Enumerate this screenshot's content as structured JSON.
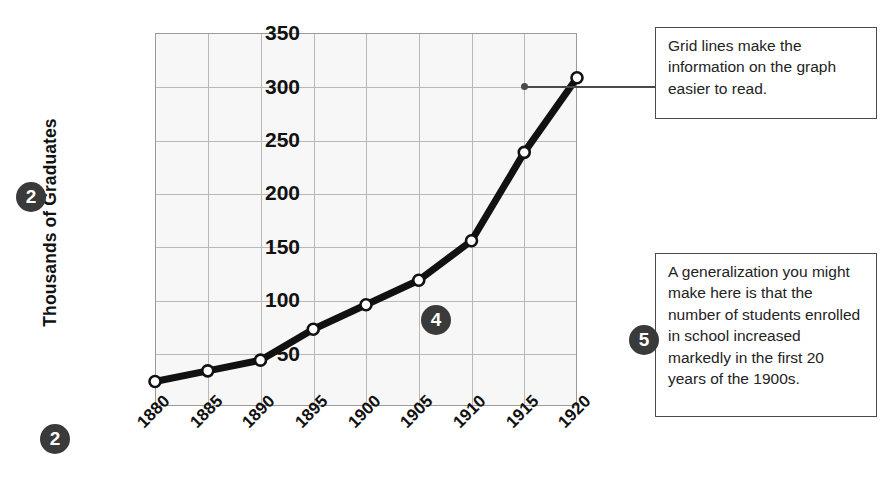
{
  "chart_data": {
    "type": "line",
    "title": "",
    "xlabel": "",
    "ylabel": "Thousands of Graduates",
    "categories": [
      "1880",
      "1885",
      "1890",
      "1895",
      "1900",
      "1905",
      "1910",
      "1915",
      "1920"
    ],
    "values": [
      23,
      33,
      43,
      72,
      95,
      118,
      155,
      238,
      308
    ],
    "x": [
      1880,
      1885,
      1890,
      1895,
      1900,
      1905,
      1910,
      1915,
      1920
    ],
    "ylim": [
      0,
      350
    ],
    "yticks": [
      50,
      100,
      150,
      200,
      250,
      300,
      350
    ],
    "xlim": [
      1880,
      1920
    ],
    "grid": true,
    "legend": false,
    "series": [
      {
        "name": "Thousands of Graduates",
        "values": [
          23,
          33,
          43,
          72,
          95,
          118,
          155,
          238,
          308
        ]
      }
    ],
    "marker": "open-circle",
    "line_color": "#111111",
    "marker_fill": "#ffffff",
    "plot_background": "#f7f7f7",
    "grid_color": "#b9b9b9"
  },
  "axes": {
    "y_title": "Thousands of Graduates",
    "y_tick_labels": [
      "350",
      "300",
      "250",
      "200",
      "150",
      "100",
      "50"
    ],
    "x_tick_labels": [
      "1880",
      "1885",
      "1890",
      "1895",
      "1900",
      "1905",
      "1910",
      "1915",
      "1920"
    ]
  },
  "badges": {
    "y_axis": "2",
    "x_axis": "2",
    "mid_chart": "4",
    "note": "5"
  },
  "callouts": {
    "grid_note": "Grid lines make the information on the graph easier to read.",
    "generalization_note": "A generalization you might make here is that the number of students enrolled in school increased markedly in the first 20 years of the 1900s."
  },
  "colors": {
    "badge_background": "#3a3a3a",
    "badge_text": "#ffffff",
    "callout_border": "#4a4a4a",
    "line": "#111111",
    "plot_bg": "#f7f7f7"
  }
}
